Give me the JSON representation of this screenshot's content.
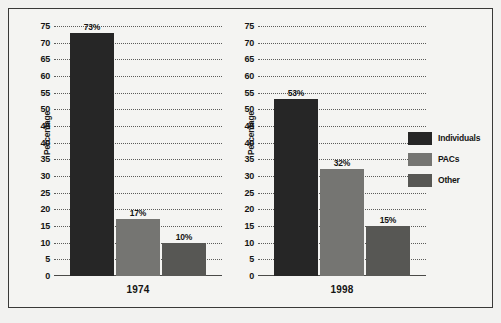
{
  "figure": {
    "background": "#f2f2f0",
    "border_color": "#3a3a38"
  },
  "chart_data": {
    "type": "bar",
    "title": "",
    "xlabel": "",
    "ylabel": "Percentage",
    "ylim": [
      0,
      75
    ],
    "ytick_step": 5,
    "yticks": [
      75,
      70,
      65,
      60,
      55,
      50,
      45,
      40,
      35,
      30,
      25,
      20,
      15,
      10,
      5,
      0
    ],
    "grid": true,
    "grid_style": "dotted",
    "legend_position": "right",
    "categories": [
      "1974",
      "1998"
    ],
    "series": [
      {
        "name": "Individuals",
        "values": [
          73,
          53
        ],
        "color": "#262626"
      },
      {
        "name": "PACs",
        "values": [
          17,
          32
        ],
        "color": "#757572"
      },
      {
        "name": "Other",
        "values": [
          10,
          15
        ],
        "color": "#575754"
      }
    ],
    "panels": [
      {
        "category": "1974",
        "axis_title": "Percentage",
        "bars": [
          {
            "series": "Individuals",
            "value": 73,
            "label": "73%",
            "color": "#262626"
          },
          {
            "series": "PACs",
            "value": 17,
            "label": "17%",
            "color": "#757572"
          },
          {
            "series": "Other",
            "value": 10,
            "label": "10%",
            "color": "#575754"
          }
        ]
      },
      {
        "category": "1998",
        "axis_title": "Percentage",
        "bars": [
          {
            "series": "Individuals",
            "value": 53,
            "label": "53%",
            "color": "#262626"
          },
          {
            "series": "PACs",
            "value": 32,
            "label": "32%",
            "color": "#757572"
          },
          {
            "series": "Other",
            "value": 15,
            "label": "15%",
            "color": "#575754"
          }
        ]
      }
    ],
    "legend": [
      {
        "label": "Individuals",
        "color": "#262626"
      },
      {
        "label": "PACs",
        "color": "#757572"
      },
      {
        "label": "Other",
        "color": "#575754"
      }
    ]
  }
}
